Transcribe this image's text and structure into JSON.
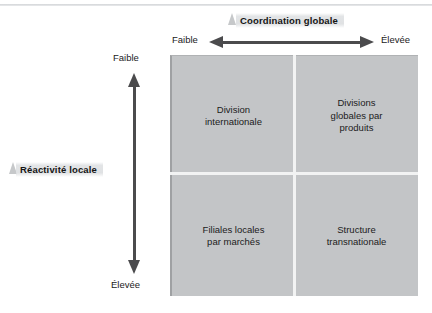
{
  "figure": {
    "colors": {
      "matrix_fill": "#c3c5c7",
      "divider": "#f2f3f3",
      "arrow": "#4b4b4d",
      "highlight_band": "#e1e3e5",
      "text": "#1b1b1b"
    }
  },
  "axes": {
    "horizontal": {
      "title": "Coordination globale",
      "low_label": "Faible",
      "high_label": "Élevée",
      "direction": "double-headed"
    },
    "vertical": {
      "title": "Réactivité locale",
      "low_label": "Faible",
      "high_label": "Élevée",
      "direction": "double-headed"
    }
  },
  "matrix": {
    "quadrants": [
      {
        "position": "top-left",
        "label": "Division\ninternationale"
      },
      {
        "position": "top-right",
        "label": "Divisions\nglobales par\nproduits"
      },
      {
        "position": "bottom-left",
        "label": "Filiales locales\npar marchés"
      },
      {
        "position": "bottom-right",
        "label": "Structure\ntransnationale"
      }
    ]
  },
  "chart_data": {
    "type": "table",
    "xlabel": "Coordination globale",
    "ylabel": "Réactivité locale",
    "x_categories": [
      "Faible",
      "Élevée"
    ],
    "y_categories": [
      "Faible",
      "Élevée"
    ],
    "cells": [
      {
        "x": "Faible",
        "y": "Faible",
        "value": "Division internationale"
      },
      {
        "x": "Élevée",
        "y": "Faible",
        "value": "Divisions globales par produits"
      },
      {
        "x": "Faible",
        "y": "Élevée",
        "value": "Filiales locales par marchés"
      },
      {
        "x": "Élevée",
        "y": "Élevée",
        "value": "Structure transnationale"
      }
    ],
    "grid": true,
    "legend": "none"
  }
}
